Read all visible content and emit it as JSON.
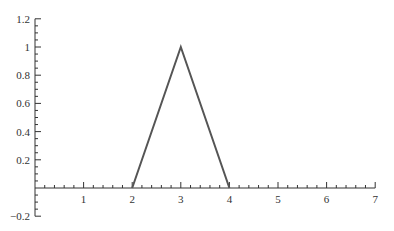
{
  "chart_data": {
    "type": "line",
    "title": "",
    "xlabel": "",
    "ylabel": "",
    "xlim": [
      0,
      7
    ],
    "ylim": [
      -0.2,
      1.2
    ],
    "grid": false,
    "legend": null,
    "x_ticks": [
      1,
      2,
      3,
      4,
      5,
      6,
      7
    ],
    "x_tick_labels": [
      "1",
      "2",
      "3",
      "4",
      "5",
      "6",
      "7"
    ],
    "x_minor_per_major": 5,
    "y_ticks": [
      -0.2,
      0.2,
      0.4,
      0.6,
      0.8,
      1,
      1.2
    ],
    "y_tick_labels": [
      "−0.2",
      "0.2",
      "0.4",
      "0.6",
      "0.8",
      "1",
      "1.2"
    ],
    "y_minor_per_major": 4,
    "series": [
      {
        "name": "triangle",
        "color": "#555555",
        "x": [
          2,
          3,
          4
        ],
        "y": [
          0,
          1,
          0
        ]
      }
    ]
  },
  "colors": {
    "axis": "#333333",
    "line": "#555555"
  }
}
